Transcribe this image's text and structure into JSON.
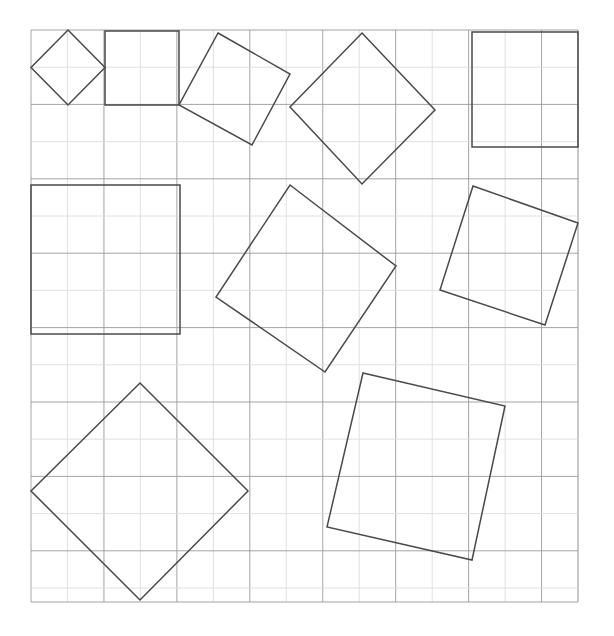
{
  "figure": {
    "kind": "geometry-worksheet",
    "background_color": "#ffffff",
    "width": 614,
    "height": 636
  },
  "grid": {
    "name": "square-lattice",
    "origin_x": 31,
    "origin_y": 30,
    "cell_width": 36.47,
    "cell_height": 37.2,
    "columns": 15,
    "rows": 15.4,
    "right_edge": 578,
    "bottom_edge": 602,
    "line_color": "#9a9a9a",
    "line_width": 0.9,
    "faint_line_color": "#dddddd"
  },
  "shapes": {
    "stroke_color": "#4a4a4a",
    "stroke_width": 1.5,
    "fill": "none",
    "count": 9,
    "items": [
      {
        "id": "square-1",
        "label": "small diamond top-left",
        "side": 52.3,
        "rotation_deg": 45,
        "center_x": 68,
        "center_y": 67.5,
        "points": "68,30 105,67.5 68,105 31,67.5"
      },
      {
        "id": "square-2",
        "label": "axis-aligned square top",
        "side": 74,
        "rotation_deg": 0,
        "center_x": 142,
        "center_y": 68,
        "points": "105,31 179,31 179,105 105,105"
      },
      {
        "id": "square-3",
        "label": "tilted square top-centre",
        "side": 83,
        "rotation_deg": 30,
        "center_x": 234.5,
        "center_y": 89,
        "points": "218,33 290,74 252,145 179,105"
      },
      {
        "id": "square-4",
        "label": "large diamond top-right-centre",
        "side": 105,
        "rotation_deg": 45,
        "center_x": 362.5,
        "center_y": 108.5,
        "points": "362,33 435,110 362,184 290,107"
      },
      {
        "id": "square-5",
        "label": "axis-aligned square top-right",
        "side": 112,
        "rotation_deg": 0,
        "center_x": 525,
        "center_y": 89,
        "points": "472,32 578,32 578,147 472,147"
      },
      {
        "id": "square-6",
        "label": "axis-aligned square left-middle",
        "side": 149,
        "rotation_deg": 0,
        "center_x": 105.5,
        "center_y": 259.5,
        "points": "31,185 180,185 180,334 31,334"
      },
      {
        "id": "square-7",
        "label": "tilted square centre",
        "side": 133,
        "rotation_deg": 37,
        "center_x": 306,
        "center_y": 278.5,
        "points": "290,185 396,266 325,372 216,297"
      },
      {
        "id": "square-8",
        "label": "tilted square right-middle",
        "side": 111,
        "rotation_deg": 19,
        "center_x": 509,
        "center_y": 255.5,
        "points": "473,186 578,223 545,325 440,290"
      },
      {
        "id": "square-9",
        "label": "large diamond bottom-left",
        "side": 152,
        "rotation_deg": 45,
        "center_x": 140,
        "center_y": 491,
        "points": "140,383 248,491 140,600 31,491"
      },
      {
        "id": "square-10",
        "label": "tilted square bottom-right",
        "side": 150,
        "rotation_deg": 13,
        "center_x": 435,
        "center_y": 460,
        "points": "363,373 505,406 472,560 327,527"
      }
    ]
  }
}
